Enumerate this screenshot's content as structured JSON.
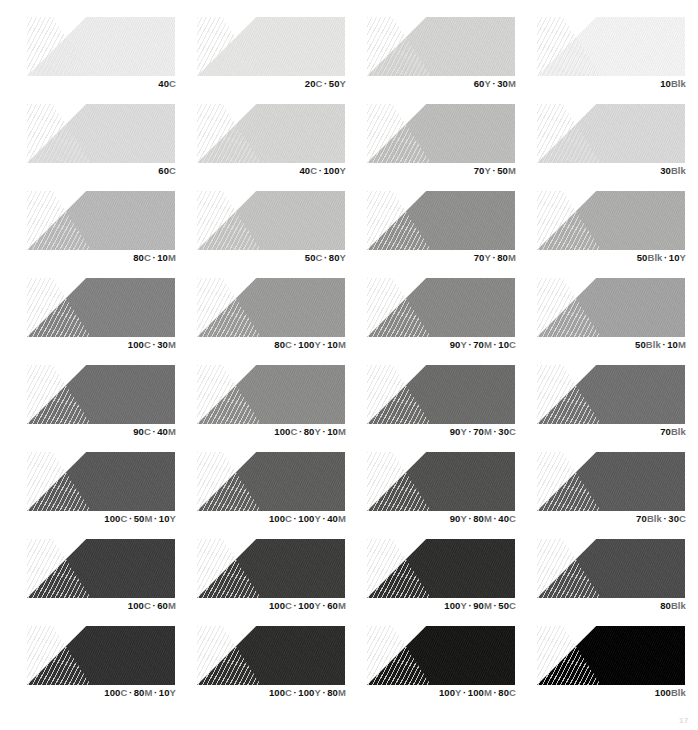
{
  "sheet": {
    "title": "Color Tint Swatch Chart",
    "background": "#ffffff",
    "columns": 4,
    "rows": 8,
    "separator": "·",
    "page_mark": "17"
  },
  "chart_data": {
    "type": "table",
    "xlabel": "",
    "ylabel": "",
    "columns": 4,
    "rows": 8,
    "swatches": [
      {
        "label": "40C",
        "parts": [
          {
            "num": "40",
            "chan": "C"
          }
        ],
        "color": "#ededed",
        "tone": 7
      },
      {
        "label": "20C · 50Y",
        "parts": [
          {
            "num": "20",
            "chan": "C"
          },
          {
            "num": "50",
            "chan": "Y"
          }
        ],
        "color": "#e6e6e4",
        "tone": 10
      },
      {
        "label": "60Y · 30M",
        "parts": [
          {
            "num": "60",
            "chan": "Y"
          },
          {
            "num": "30",
            "chan": "M"
          }
        ],
        "color": "#d4d4d2",
        "tone": 17
      },
      {
        "label": "10Blk",
        "parts": [
          {
            "num": "10",
            "chan": "Blk"
          }
        ],
        "color": "#f4f4f4",
        "tone": 4
      },
      {
        "label": "60C",
        "parts": [
          {
            "num": "60",
            "chan": "C"
          }
        ],
        "color": "#dcdcdc",
        "tone": 14
      },
      {
        "label": "40C · 100Y",
        "parts": [
          {
            "num": "40",
            "chan": "C"
          },
          {
            "num": "100",
            "chan": "Y"
          }
        ],
        "color": "#d6d6d4",
        "tone": 16
      },
      {
        "label": "70Y · 50M",
        "parts": [
          {
            "num": "70",
            "chan": "Y"
          },
          {
            "num": "50",
            "chan": "M"
          }
        ],
        "color": "#bdbdbb",
        "tone": 26
      },
      {
        "label": "30Blk",
        "parts": [
          {
            "num": "30",
            "chan": "Blk"
          }
        ],
        "color": "#d9d9d9",
        "tone": 15
      },
      {
        "label": "80C · 10M",
        "parts": [
          {
            "num": "80",
            "chan": "C"
          },
          {
            "num": "10",
            "chan": "M"
          }
        ],
        "color": "#b8b8b8",
        "tone": 28
      },
      {
        "label": "50C · 80Y",
        "parts": [
          {
            "num": "50",
            "chan": "C"
          },
          {
            "num": "80",
            "chan": "Y"
          }
        ],
        "color": "#c3c3c1",
        "tone": 24
      },
      {
        "label": "70Y · 80M",
        "parts": [
          {
            "num": "70",
            "chan": "Y"
          },
          {
            "num": "80",
            "chan": "M"
          }
        ],
        "color": "#8f8f8d",
        "tone": 44
      },
      {
        "label": "50Blk · 10Y",
        "parts": [
          {
            "num": "50",
            "chan": "Blk"
          },
          {
            "num": "10",
            "chan": "Y"
          }
        ],
        "color": "#adadab",
        "tone": 32
      },
      {
        "label": "100C · 30M",
        "parts": [
          {
            "num": "100",
            "chan": "C"
          },
          {
            "num": "30",
            "chan": "M"
          }
        ],
        "color": "#818181",
        "tone": 49
      },
      {
        "label": "80C · 100Y · 10M",
        "parts": [
          {
            "num": "80",
            "chan": "C"
          },
          {
            "num": "100",
            "chan": "Y"
          },
          {
            "num": "10",
            "chan": "M"
          }
        ],
        "color": "#9a9a98",
        "tone": 40
      },
      {
        "label": "90Y · 70M · 10C",
        "parts": [
          {
            "num": "90",
            "chan": "Y"
          },
          {
            "num": "70",
            "chan": "M"
          },
          {
            "num": "10",
            "chan": "C"
          }
        ],
        "color": "#878785",
        "tone": 47
      },
      {
        "label": "50Blk · 10M",
        "parts": [
          {
            "num": "50",
            "chan": "Blk"
          },
          {
            "num": "10",
            "chan": "M"
          }
        ],
        "color": "#a2a2a2",
        "tone": 36
      },
      {
        "label": "90C · 40M",
        "parts": [
          {
            "num": "90",
            "chan": "C"
          },
          {
            "num": "40",
            "chan": "M"
          }
        ],
        "color": "#6e6e6e",
        "tone": 57
      },
      {
        "label": "100C · 80Y · 10M",
        "parts": [
          {
            "num": "100",
            "chan": "C"
          },
          {
            "num": "80",
            "chan": "Y"
          },
          {
            "num": "10",
            "chan": "M"
          }
        ],
        "color": "#8a8a88",
        "tone": 46
      },
      {
        "label": "90Y · 70M · 30C",
        "parts": [
          {
            "num": "90",
            "chan": "Y"
          },
          {
            "num": "70",
            "chan": "M"
          },
          {
            "num": "30",
            "chan": "C"
          }
        ],
        "color": "#6a6a68",
        "tone": 58
      },
      {
        "label": "70Blk",
        "parts": [
          {
            "num": "70",
            "chan": "Blk"
          }
        ],
        "color": "#6f6f6f",
        "tone": 56
      },
      {
        "label": "100C · 50M · 10Y",
        "parts": [
          {
            "num": "100",
            "chan": "C"
          },
          {
            "num": "50",
            "chan": "M"
          },
          {
            "num": "10",
            "chan": "Y"
          }
        ],
        "color": "#575757",
        "tone": 66
      },
      {
        "label": "100C · 100Y · 40M",
        "parts": [
          {
            "num": "100",
            "chan": "C"
          },
          {
            "num": "100",
            "chan": "Y"
          },
          {
            "num": "40",
            "chan": "M"
          }
        ],
        "color": "#5c5c5a",
        "tone": 64
      },
      {
        "label": "90Y · 80M · 40C",
        "parts": [
          {
            "num": "90",
            "chan": "Y"
          },
          {
            "num": "80",
            "chan": "M"
          },
          {
            "num": "40",
            "chan": "C"
          }
        ],
        "color": "#4e4e4c",
        "tone": 70
      },
      {
        "label": "70Blk · 30C",
        "parts": [
          {
            "num": "70",
            "chan": "Blk"
          },
          {
            "num": "30",
            "chan": "C"
          }
        ],
        "color": "#5a5a5a",
        "tone": 65
      },
      {
        "label": "100C · 60M",
        "parts": [
          {
            "num": "100",
            "chan": "C"
          },
          {
            "num": "60",
            "chan": "M"
          }
        ],
        "color": "#3c3c3c",
        "tone": 77
      },
      {
        "label": "100C · 100Y · 60M",
        "parts": [
          {
            "num": "100",
            "chan": "C"
          },
          {
            "num": "100",
            "chan": "Y"
          },
          {
            "num": "60",
            "chan": "M"
          }
        ],
        "color": "#3a3a38",
        "tone": 78
      },
      {
        "label": "100Y · 90M · 50C",
        "parts": [
          {
            "num": "100",
            "chan": "Y"
          },
          {
            "num": "90",
            "chan": "M"
          },
          {
            "num": "50",
            "chan": "C"
          }
        ],
        "color": "#2b2b29",
        "tone": 84
      },
      {
        "label": "80Blk",
        "parts": [
          {
            "num": "80",
            "chan": "Blk"
          }
        ],
        "color": "#4a4a4a",
        "tone": 71
      },
      {
        "label": "100C · 80M · 10Y",
        "parts": [
          {
            "num": "100",
            "chan": "C"
          },
          {
            "num": "80",
            "chan": "M"
          },
          {
            "num": "10",
            "chan": "Y"
          }
        ],
        "color": "#2e2e2e",
        "tone": 82
      },
      {
        "label": "100C · 100Y · 80M",
        "parts": [
          {
            "num": "100",
            "chan": "C"
          },
          {
            "num": "100",
            "chan": "Y"
          },
          {
            "num": "80",
            "chan": "M"
          }
        ],
        "color": "#2a2a28",
        "tone": 84
      },
      {
        "label": "100Y · 100M · 80C",
        "parts": [
          {
            "num": "100",
            "chan": "Y"
          },
          {
            "num": "100",
            "chan": "M"
          },
          {
            "num": "80",
            "chan": "C"
          }
        ],
        "color": "#141412",
        "tone": 92
      },
      {
        "label": "100Blk",
        "parts": [
          {
            "num": "100",
            "chan": "Blk"
          }
        ],
        "color": "#000000",
        "tone": 100
      }
    ]
  }
}
